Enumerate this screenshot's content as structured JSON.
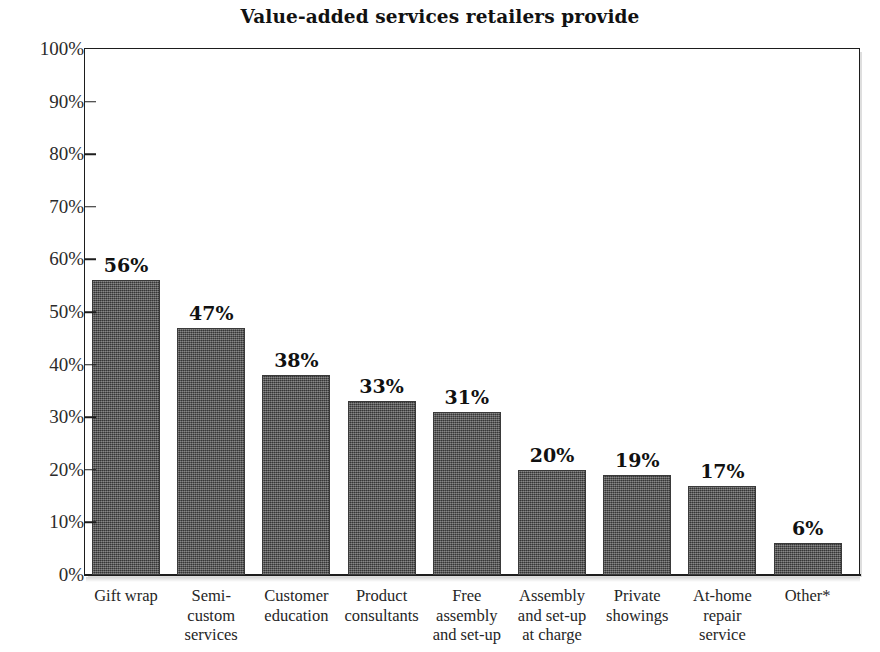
{
  "chart_data": {
    "type": "bar",
    "title": "Value-added services retailers provide",
    "xlabel": "",
    "ylabel": "",
    "ylim": [
      0,
      100
    ],
    "ytick_labels": [
      "100%",
      "90%",
      "80%",
      "70%",
      "60%",
      "50%",
      "40%",
      "30%",
      "20%",
      "10%",
      "0%"
    ],
    "ytick_values": [
      100,
      90,
      80,
      70,
      60,
      50,
      40,
      30,
      20,
      10,
      0
    ],
    "grid": false,
    "legend": false,
    "value_suffix": "%",
    "bar_color": "#4b4b4b",
    "categories": [
      "Gift wrap",
      "Semi-\ncustom\nservices",
      "Customer\neducation",
      "Product\nconsultants",
      "Free\nassembly\nand set-up",
      "Assembly\nand set-up\nat charge",
      "Private\nshowings",
      "At-home\nrepair\nservice",
      "Other*"
    ],
    "values": [
      56,
      47,
      38,
      33,
      31,
      20,
      19,
      17,
      6
    ],
    "value_labels": [
      "56%",
      "47%",
      "38%",
      "33%",
      "31%",
      "20%",
      "19%",
      "17%",
      "6%"
    ]
  }
}
